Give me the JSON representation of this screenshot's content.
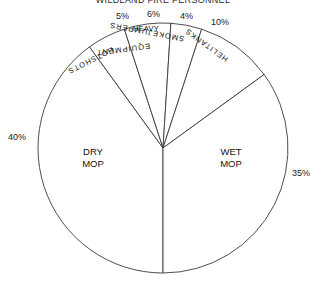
{
  "chart_data": {
    "type": "pie",
    "title": "WILDLAND FIRE PERSONNEL",
    "categories": [
      "DRY MOP",
      "HOTSHOTS",
      "HEAVY EQUIPMENT",
      "SMOKEJUMPERS",
      "HELITANKS",
      "WET MOP"
    ],
    "values": [
      40,
      5,
      6,
      4,
      10,
      35
    ],
    "value_labels": [
      "40%",
      "5%",
      "6%",
      "4%",
      "10%",
      "35%"
    ],
    "unit": "percent",
    "total": 100,
    "legend": "none",
    "grid": false,
    "start_angle_deg": 180,
    "direction": "clockwise",
    "fill": "#ffffff",
    "stroke": "#3a3a3a",
    "slices": [
      {
        "name": "DRY MOP",
        "label": "DRY MOP",
        "label_line1": "DRY",
        "label_line2": "MOP",
        "percent": 40,
        "percent_label": "40%",
        "label_placement": "inside-horizontal",
        "percent_placement": "outside-left"
      },
      {
        "name": "HOTSHOTS",
        "label": "HOTSHOTS",
        "percent": 5,
        "percent_label": "5%",
        "label_placement": "inside-rotated",
        "percent_placement": "outside-top"
      },
      {
        "name": "HEAVY EQUIPMENT",
        "label": "HEAVY EQUIPMENT",
        "label_line1": "HEAVY",
        "label_line2": "EQUIPMENT",
        "percent": 6,
        "percent_label": "6%",
        "label_placement": "inside-rotated",
        "percent_placement": "outside-top"
      },
      {
        "name": "SMOKEJUMPERS",
        "label": "SMOKEJUMPERS",
        "percent": 4,
        "percent_label": "4%",
        "label_placement": "inside-rotated",
        "percent_placement": "outside-top"
      },
      {
        "name": "HELITANKS",
        "label": "HELITANKS",
        "percent": 10,
        "percent_label": "10%",
        "label_placement": "inside-rotated",
        "percent_placement": "outside-top"
      },
      {
        "name": "WET MOP",
        "label": "WET MOP",
        "label_line1": "WET",
        "label_line2": "MOP",
        "percent": 35,
        "percent_label": "35%",
        "label_placement": "inside-horizontal",
        "percent_placement": "outside-right"
      }
    ]
  }
}
